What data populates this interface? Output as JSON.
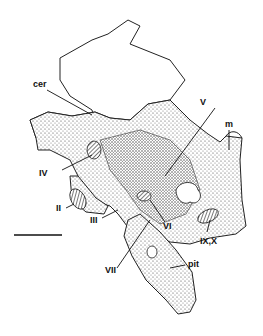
{
  "figure": {
    "labels": {
      "cer": "cer",
      "iv": "IV",
      "ii": "II",
      "iii": "III",
      "v": "V",
      "m": "m",
      "vi": "VI",
      "vii": "VII",
      "ix_x": "IX,X",
      "pit": "pit"
    },
    "scale_bar": {
      "length_px": 48
    },
    "colors": {
      "ink": "#111111",
      "paper": "#ffffff",
      "stipple": "#555555"
    }
  }
}
